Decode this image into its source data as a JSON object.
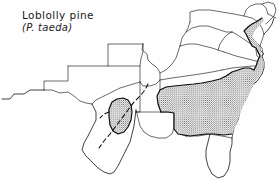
{
  "figure": {
    "kind": "species-range-map",
    "common_name": "Loblolly pine",
    "scientific_name": "(P. taeda)",
    "region_depicted": "southeastern United States",
    "colors": {
      "ink": "#111111",
      "paper": "#ffffff",
      "stipple": "#1a1a1a"
    },
    "legend_implied": {
      "stippled_fill": "natural range of species",
      "dashed_line": "approximate / inferred western range limit",
      "thin_lines": "state boundaries"
    },
    "range_notes": {
      "main_block": "continuous coastal plain and piedmont range from east Texas and Louisiana across the Gulf states, north through Arkansas, Tennessee and the Carolinas, and up the Atlantic coastal plain through Virginia, Maryland, Delaware and New Jersey",
      "disjunct_block": "isolated Lost Pines population in east-central Texas",
      "excluded_areas": "southern Florida peninsula, southern Texas, Appalachian highlands"
    }
  }
}
